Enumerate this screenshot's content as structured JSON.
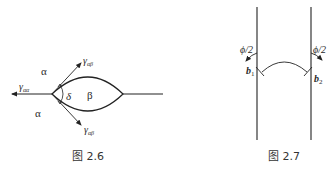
{
  "figures": [
    {
      "id": "fig-2-6",
      "caption": "图 2.6",
      "labels": {
        "phase_alpha_top": "α",
        "phase_alpha_bottom": "α",
        "phase_beta": "β",
        "angle": "δ",
        "gamma_aa_main": "γ",
        "gamma_aa_sub": "αα",
        "gamma_ab_top_main": "γ",
        "gamma_ab_top_sub": "αβ",
        "gamma_ab_bottom_main": "γ",
        "gamma_ab_bottom_sub": "αβ"
      }
    },
    {
      "id": "fig-2-7",
      "caption": "图 2.7",
      "labels": {
        "b1_main": "b",
        "b1_sub": "1",
        "b2_main": "b",
        "b2_sub": "2",
        "phi_left": "ϕ/2",
        "phi_right": "ϕ/2"
      }
    }
  ],
  "colors": {
    "ink": "#222222",
    "background": "#ffffff"
  }
}
